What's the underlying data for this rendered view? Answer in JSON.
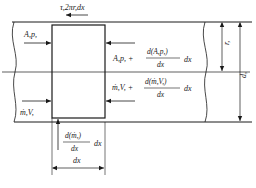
{
  "diagram": {
    "type": "control-volume pipe flow element",
    "shear_label": "τ,2πr,dx",
    "inlet_pressure_label": "A,p,",
    "outlet_pressure_label_base": "A,p, +",
    "outlet_pressure_deriv_num": "d(A,p,)",
    "outlet_pressure_deriv_den": "dx",
    "outlet_pressure_suffix": "dx",
    "inlet_momentum_label": "ṁ,V,",
    "outlet_momentum_label_base": "ṁ,V, +",
    "outlet_momentum_deriv_num": "d(ṁ,V,)",
    "outlet_momentum_deriv_den": "dx",
    "outlet_momentum_suffix": "dx",
    "mass_addition_num": "d(ṁ,)",
    "mass_addition_den": "dx",
    "mass_addition_suffix": "dx",
    "element_length_label": "dx",
    "radius_label": "r,",
    "diameter_label": "d,"
  },
  "colors": {
    "line": "#1a1a1a",
    "background": "#ffffff"
  }
}
